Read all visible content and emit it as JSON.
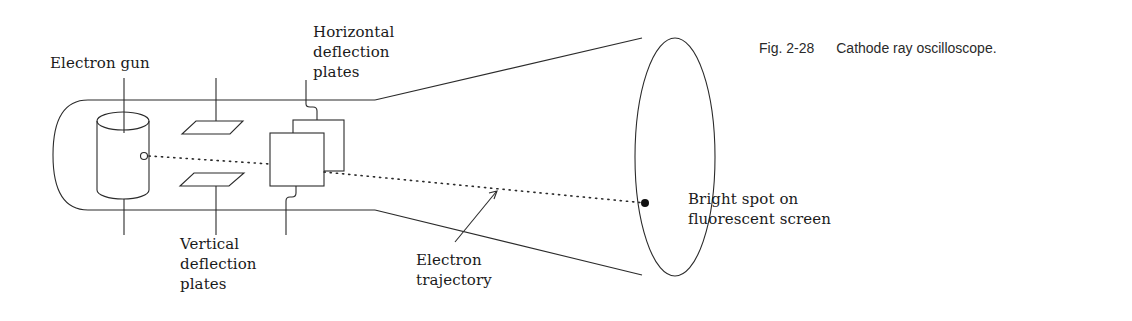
{
  "figure": {
    "number": "Fig. 2-28",
    "title": "Cathode ray oscilloscope."
  },
  "labels": {
    "electron_gun": "Electron gun",
    "horizontal_plates": [
      "Horizontal",
      "deflection",
      "plates"
    ],
    "vertical_plates": [
      "Vertical",
      "deflection",
      "plates"
    ],
    "trajectory": [
      "Electron",
      "trajectory"
    ],
    "bright_spot": [
      "Bright spot on",
      "fluorescent screen"
    ]
  },
  "colors": {
    "line": "#2b2b2b",
    "background": "#ffffff"
  }
}
